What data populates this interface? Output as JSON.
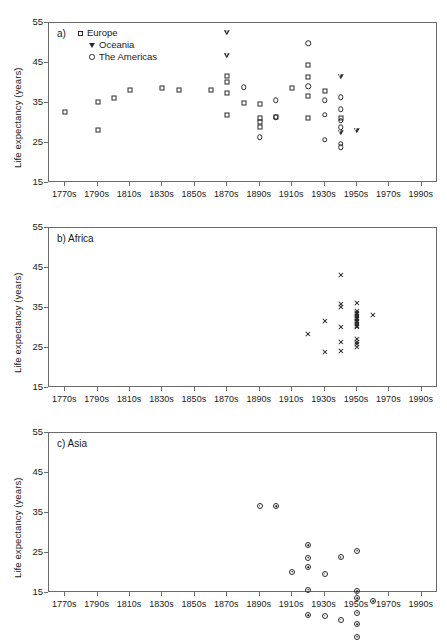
{
  "figure": {
    "ylabel": "Life expectancy (years)",
    "y_ticks": [
      "15",
      "25",
      "35",
      "45",
      "55"
    ],
    "y_values": [
      15,
      25,
      35,
      45,
      55
    ],
    "ylim": [
      15,
      55
    ],
    "x_ticks": [
      "1770s",
      "1790s",
      "1810s",
      "1830s",
      "1850s",
      "1870s",
      "1890s",
      "1910s",
      "1930s",
      "1950s",
      "1970s",
      "1990s"
    ],
    "x_values": [
      1770,
      1790,
      1810,
      1830,
      1850,
      1870,
      1890,
      1910,
      1930,
      1950,
      1970,
      1990
    ],
    "xlim": [
      1760,
      2000
    ]
  },
  "panels": [
    {
      "key": "a",
      "label": "a)",
      "title": "",
      "label_full": "a)"
    },
    {
      "key": "b",
      "label": "b)",
      "title": "Africa",
      "label_full": "b) Africa"
    },
    {
      "key": "c",
      "label": "c)",
      "title": "Asia",
      "label_full": "c) Asia"
    }
  ],
  "legend": {
    "items": [
      {
        "symbol": "square",
        "label": "Europe"
      },
      {
        "symbol": "triangle-down",
        "label": "Oceania"
      },
      {
        "symbol": "circle",
        "label": "The Americas"
      }
    ]
  },
  "chart_data": [
    {
      "type": "scatter",
      "panel": "a",
      "title": "a)",
      "xlabel": "",
      "ylabel": "Life expectancy (years)",
      "ylim": [
        15,
        55
      ],
      "xlim": [
        1760,
        2000
      ],
      "grid": false,
      "legend_position": "top-left",
      "series": [
        {
          "name": "Europe",
          "marker": "square",
          "points": [
            [
              1770,
              32.8
            ],
            [
              1790,
              35.2
            ],
            [
              1790,
              28.2
            ],
            [
              1800,
              36.2
            ],
            [
              1810,
              38.2
            ],
            [
              1830,
              38.8
            ],
            [
              1840,
              38.2
            ],
            [
              1860,
              38.2
            ],
            [
              1870,
              41.8
            ],
            [
              1870,
              40.2
            ],
            [
              1870,
              37.4
            ],
            [
              1870,
              32.0
            ],
            [
              1880,
              35.0
            ],
            [
              1890,
              34.7
            ],
            [
              1890,
              31.3
            ],
            [
              1890,
              30.2
            ],
            [
              1890,
              29.0
            ],
            [
              1900,
              31.4
            ],
            [
              1910,
              38.8
            ],
            [
              1920,
              44.6
            ],
            [
              1920,
              41.5
            ],
            [
              1920,
              36.8
            ],
            [
              1920,
              31.2
            ],
            [
              1930,
              37.9
            ],
            [
              1940,
              31.3
            ]
          ]
        },
        {
          "name": "Oceania",
          "marker": "triangle-down",
          "points": [
            [
              1870,
              52.5
            ],
            [
              1870,
              48.0
            ],
            [
              1940,
              44.2
            ],
            [
              1940,
              31.5
            ],
            [
              1950,
              33.4
            ]
          ]
        },
        {
          "name": "The Americas",
          "marker": "circle",
          "points": [
            [
              1880,
              39.0
            ],
            [
              1890,
              26.4
            ],
            [
              1900,
              35.7
            ],
            [
              1900,
              31.4
            ],
            [
              1920,
              50.0
            ],
            [
              1920,
              39.2
            ],
            [
              1930,
              35.7
            ],
            [
              1930,
              32.1
            ],
            [
              1930,
              25.8
            ],
            [
              1940,
              36.4
            ],
            [
              1940,
              33.5
            ],
            [
              1940,
              30.6
            ],
            [
              1940,
              29.0
            ],
            [
              1940,
              24.8
            ],
            [
              1940,
              23.9
            ]
          ]
        }
      ]
    },
    {
      "type": "scatter",
      "panel": "b",
      "title": "b) Africa",
      "xlabel": "",
      "ylabel": "Life expectancy (years)",
      "ylim": [
        15,
        55
      ],
      "xlim": [
        1760,
        2000
      ],
      "grid": false,
      "series": [
        {
          "name": "Africa",
          "marker": "x",
          "points": [
            [
              1920,
              28.4
            ],
            [
              1930,
              31.8
            ],
            [
              1930,
              23.9
            ],
            [
              1940,
              43.2
            ],
            [
              1940,
              36.0
            ],
            [
              1940,
              35.2
            ],
            [
              1940,
              30.2
            ],
            [
              1940,
              26.4
            ],
            [
              1940,
              24.2
            ],
            [
              1950,
              36.2
            ],
            [
              1950,
              34.2
            ],
            [
              1950,
              33.8
            ],
            [
              1950,
              33.4
            ],
            [
              1950,
              33.0
            ],
            [
              1950,
              32.6
            ],
            [
              1950,
              32.2
            ],
            [
              1950,
              31.8
            ],
            [
              1950,
              31.4
            ],
            [
              1950,
              31.0
            ],
            [
              1950,
              30.6
            ],
            [
              1950,
              30.2
            ],
            [
              1950,
              27.3
            ],
            [
              1950,
              26.6
            ],
            [
              1950,
              25.9
            ],
            [
              1950,
              25.2
            ],
            [
              1960,
              33.2
            ]
          ]
        }
      ]
    },
    {
      "type": "scatter",
      "panel": "c",
      "title": "c) Asia",
      "xlabel": "",
      "ylabel": "Life expectancy (years)",
      "ylim": [
        15,
        55
      ],
      "xlim": [
        1760,
        2000
      ],
      "grid": false,
      "series": [
        {
          "name": "Asia",
          "marker": "circle-dot",
          "points": [
            [
              1890,
              36.8
            ],
            [
              1900,
              38.2
            ],
            [
              1910,
              23.3
            ],
            [
              1920,
              31.4
            ],
            [
              1920,
              29.8
            ],
            [
              1920,
              29.0
            ],
            [
              1920,
              24.8
            ],
            [
              1920,
              19.9
            ],
            [
              1930,
              31.8
            ],
            [
              1930,
              22.8
            ],
            [
              1940,
              39.0
            ],
            [
              1940,
              24.8
            ],
            [
              1950,
              43.6
            ],
            [
              1950,
              35.0
            ],
            [
              1950,
              34.7
            ],
            [
              1950,
              32.6
            ],
            [
              1950,
              31.2
            ],
            [
              1950,
              29.6
            ],
            [
              1960,
              39.9
            ]
          ]
        }
      ]
    }
  ]
}
